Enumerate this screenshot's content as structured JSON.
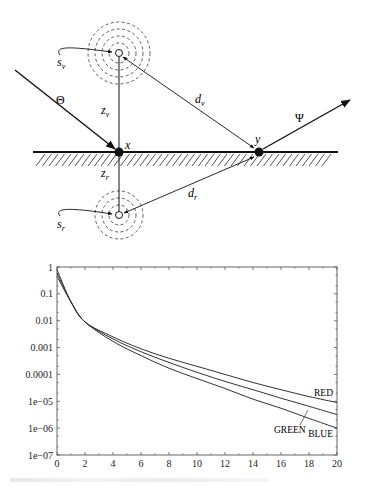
{
  "diagram": {
    "labels": {
      "s_v": "s",
      "s_v_sub": "v",
      "s_r": "s",
      "s_r_sub": "r",
      "theta": "Θ",
      "z_v": "z",
      "z_v_sub": "v",
      "z_r": "z",
      "z_r_sub": "r",
      "d_v": "d",
      "d_v_sub": "v",
      "d_r": "d",
      "d_r_sub": "r",
      "psi": "Ψ",
      "x": "x",
      "y": "y"
    },
    "elements": [
      "virtual source (hollow circle) with dashed concentric rings, above surface",
      "real source (hollow circle) with dashed concentric rings, below surface",
      "incident arrow Θ hitting point x",
      "outgoing arrow Ψ leaving point y",
      "vertical line from virtual source through x to real source",
      "double arrow d_v between virtual source and y",
      "double arrow d_r between real source and y",
      "hatched surface line"
    ]
  },
  "chart_data": {
    "type": "line",
    "title": "",
    "xlabel": "",
    "ylabel": "",
    "yscale": "log",
    "xlim": [
      0,
      20
    ],
    "ylim": [
      1e-07,
      1
    ],
    "x_ticks": [
      "0",
      "2",
      "4",
      "6",
      "8",
      "10",
      "12",
      "14",
      "16",
      "18",
      "20"
    ],
    "y_ticks": [
      "1",
      "0.1",
      "0.01",
      "0.001",
      "0.0001",
      "1e-05",
      "1e-06",
      "1e-07"
    ],
    "grid": false,
    "legend": "inline labels at right end of curves",
    "x": [
      0,
      1,
      2,
      4,
      6,
      8,
      10,
      12,
      14,
      16,
      18,
      20
    ],
    "series": [
      {
        "name": "RED",
        "values": [
          0.8,
          0.05,
          0.009,
          0.0025,
          0.0009,
          0.0004,
          0.0002,
          0.0001,
          5e-05,
          2.7e-05,
          1.5e-05,
          9e-06
        ]
      },
      {
        "name": "GREEN",
        "values": [
          0.6,
          0.05,
          0.009,
          0.0021,
          0.0007,
          0.00028,
          0.00012,
          5.5e-05,
          2.7e-05,
          1.3e-05,
          6.5e-06,
          3.2e-06
        ]
      },
      {
        "name": "BLUE",
        "values": [
          0.45,
          0.05,
          0.009,
          0.0017,
          0.0005,
          0.00017,
          7e-05,
          3e-05,
          1.2e-05,
          5.5e-06,
          2.3e-06,
          1e-06
        ]
      }
    ],
    "series_labels": {
      "red": "RED",
      "green": "GREEN",
      "blue": "BLUE"
    }
  }
}
